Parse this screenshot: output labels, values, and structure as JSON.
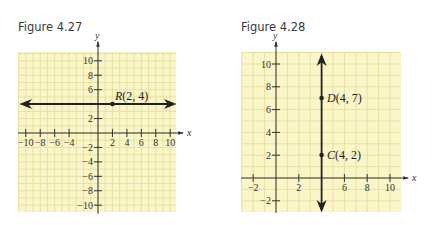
{
  "colors": {
    "grid_bg": "#fbf6c8",
    "grid_line": "#e6e0a6",
    "axis": "#2a2a2a",
    "line": "#222222"
  },
  "chart_data": [
    {
      "type": "line",
      "title": "Figure 4.27",
      "xlabel": "x",
      "ylabel": "y",
      "xlim": [
        -11,
        11
      ],
      "ylim": [
        -11,
        11
      ],
      "grid": true,
      "x_ticks": [
        -10,
        -8,
        -6,
        -4,
        2,
        4,
        6,
        8,
        10
      ],
      "y_ticks": [
        10,
        8,
        6,
        2,
        -2,
        -4,
        -6,
        -8,
        -10
      ],
      "series": [
        {
          "name": "horizontal line y = 4",
          "kind": "horizontal",
          "value": 4
        }
      ],
      "points": [
        {
          "label": "R(2, 4)",
          "name": "R",
          "x": 2,
          "y": 4
        }
      ]
    },
    {
      "type": "line",
      "title": "Figure 4.28",
      "xlabel": "x",
      "ylabel": "y",
      "xlim": [
        -3,
        11
      ],
      "ylim": [
        -3,
        11
      ],
      "grid": true,
      "x_ticks": [
        -2,
        2,
        6,
        8,
        10
      ],
      "y_ticks": [
        10,
        8,
        6,
        4,
        2,
        -2
      ],
      "series": [
        {
          "name": "vertical line x = 4",
          "kind": "vertical",
          "value": 4
        }
      ],
      "points": [
        {
          "label": "D(4, 7)",
          "name": "D",
          "x": 4,
          "y": 7
        },
        {
          "label": "C(4, 2)",
          "name": "C",
          "x": 4,
          "y": 2
        }
      ]
    }
  ],
  "figures": {
    "fig1": {
      "title": "Figure 4.27",
      "x_axis": "x",
      "y_axis": "y",
      "point_label": "R(2, 4)",
      "xticks": [
        "−10",
        "−8",
        "−6",
        "−4",
        "2",
        "4",
        "6",
        "8",
        "10"
      ],
      "yticks": [
        "10",
        "8",
        "6",
        "2",
        "−2",
        "−4",
        "−6",
        "−8",
        "−10"
      ]
    },
    "fig2": {
      "title": "Figure 4.28",
      "x_axis": "x",
      "y_axis": "y",
      "point_d": "D(4, 7)",
      "point_c": "C(4, 2)",
      "xticks": [
        "−2",
        "2",
        "6",
        "8",
        "10"
      ],
      "yticks": [
        "10",
        "8",
        "6",
        "4",
        "2",
        "−2"
      ]
    }
  }
}
